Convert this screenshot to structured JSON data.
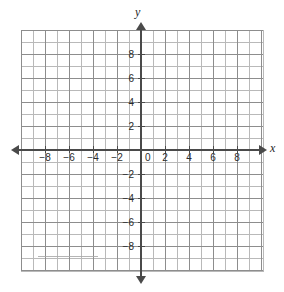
{
  "figure": {
    "background_color": "#ffffff"
  },
  "axes": {
    "x_axis_name": "x",
    "y_axis_name": "y",
    "origin_label": "0",
    "axis_color": "#4a4a4a",
    "arrows": {
      "x_left": "arrow-left",
      "x_right": "arrow-right",
      "y_top": "arrow-up",
      "y_bottom": "arrow-down"
    }
  },
  "grid": {
    "minor_color": "#b9b9b9",
    "major_color": "#8d8d8d",
    "minor_step": 1,
    "major_step": 2,
    "pixels_per_unit": 12
  },
  "chart_data": {
    "type": "scatter",
    "title": "",
    "xlabel": "x",
    "ylabel": "y",
    "xlim": [
      -10,
      10.25
    ],
    "ylim": [
      -10.17,
      10
    ],
    "xticks": [
      -8,
      -6,
      -4,
      -2,
      0,
      2,
      4,
      6,
      8
    ],
    "yticks": [
      -8,
      -6,
      -4,
      -2,
      2,
      4,
      6,
      8
    ],
    "xticklabels": [
      "−8",
      "−6",
      "−4",
      "−2",
      "0",
      "2",
      "4",
      "6",
      "8"
    ],
    "yticklabels": [
      "−8",
      "−6",
      "−4",
      "−2",
      "2",
      "4",
      "6",
      "8"
    ],
    "grid": true,
    "minor_grid": true,
    "legend": null,
    "series": [],
    "x": [],
    "y": []
  }
}
